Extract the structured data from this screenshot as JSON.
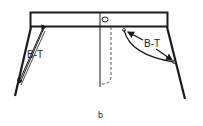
{
  "diagram": {
    "subtitle": "b",
    "labels": {
      "left_measure": "B-T",
      "right_measure": "B-T"
    },
    "colors": {
      "stroke": "#1a1a1a",
      "background": "#ffffff"
    }
  }
}
